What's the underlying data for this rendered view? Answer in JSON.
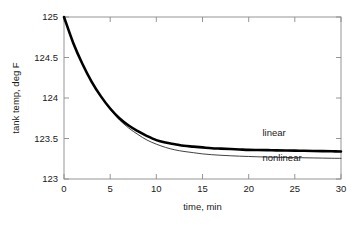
{
  "chart_data": {
    "type": "line",
    "title": "",
    "xlabel": "time, min",
    "ylabel": "tank temp, deg F",
    "xlim": [
      0,
      30
    ],
    "ylim": [
      123,
      125
    ],
    "xticks": [
      "0",
      "5",
      "10",
      "15",
      "20",
      "25",
      "30"
    ],
    "xtick_values": [
      0,
      5,
      10,
      15,
      20,
      25,
      30
    ],
    "yticks": [
      "123",
      "123.5",
      "124",
      "124.5",
      "125"
    ],
    "ytick_values": [
      123,
      123.5,
      124,
      124.5,
      125
    ],
    "grid": false,
    "legend_position": "inline-annotation",
    "x": [
      0,
      1,
      2,
      3,
      4,
      5,
      6,
      7,
      8,
      9,
      10,
      11,
      12,
      13,
      14,
      15,
      16,
      17,
      18,
      19,
      20,
      21,
      22,
      23,
      24,
      25,
      26,
      27,
      28,
      29,
      30
    ],
    "series": [
      {
        "name": "linear",
        "line_style": "thick",
        "color": "#000000",
        "label_text": "linear",
        "values": [
          125.0,
          124.68,
          124.42,
          124.2,
          124.02,
          123.87,
          123.75,
          123.66,
          123.59,
          123.53,
          123.48,
          123.45,
          123.43,
          123.41,
          123.4,
          123.39,
          123.38,
          123.375,
          123.37,
          123.365,
          123.36,
          123.358,
          123.356,
          123.354,
          123.352,
          123.35,
          123.348,
          123.346,
          123.344,
          123.342,
          123.34
        ]
      },
      {
        "name": "nonlinear",
        "line_style": "thin",
        "color": "#2b2b2b",
        "label_text": "nonlinear",
        "values": [
          125.0,
          124.68,
          124.42,
          124.2,
          124.02,
          123.86,
          123.73,
          123.63,
          123.55,
          123.48,
          123.43,
          123.39,
          123.36,
          123.34,
          123.325,
          123.31,
          123.3,
          123.293,
          123.287,
          123.282,
          123.278,
          123.274,
          123.271,
          123.268,
          123.266,
          123.264,
          123.262,
          123.26,
          123.258,
          123.256,
          123.255
        ]
      }
    ],
    "annotations": [
      {
        "text": "linear",
        "x": 21.5,
        "y": 123.53
      },
      {
        "text": "nonlinear",
        "x": 21.5,
        "y": 123.22
      }
    ]
  }
}
